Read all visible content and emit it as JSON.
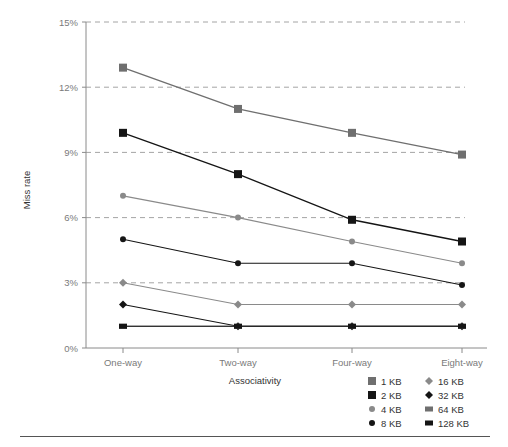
{
  "chart_data": {
    "type": "line",
    "title": "",
    "subtitle": "",
    "xlabel": "Associativity",
    "ylabel": "Miss rate",
    "categories": [
      "One-way",
      "Two-way",
      "Four-way",
      "Eight-way"
    ],
    "ytick_labels": [
      "0%",
      "3%",
      "6%",
      "9%",
      "12%",
      "15%"
    ],
    "ytick_values": [
      0,
      3,
      6,
      9,
      12,
      15
    ],
    "ylim": [
      0,
      15
    ],
    "grid": "horizontal-dashed",
    "legend_position": "bottom-right",
    "units": "percent",
    "series": [
      {
        "name": "1 KB",
        "marker": "square-large",
        "color": "#6f6f6f",
        "line_color": "#6f6f6f",
        "values": [
          12.9,
          11.0,
          9.9,
          8.9
        ]
      },
      {
        "name": "2 KB",
        "marker": "square-large",
        "color": "#151515",
        "line_color": "#151515",
        "values": [
          9.9,
          8.0,
          5.9,
          4.9
        ]
      },
      {
        "name": "4 KB",
        "marker": "circle-small",
        "color": "#8a8a8a",
        "line_color": "#8a8a8a",
        "values": [
          7.0,
          6.0,
          4.9,
          3.9
        ]
      },
      {
        "name": "8 KB",
        "marker": "circle-small",
        "color": "#151515",
        "line_color": "#151515",
        "values": [
          5.0,
          3.9,
          3.9,
          2.9
        ]
      },
      {
        "name": "16 KB",
        "marker": "diamond-small",
        "color": "#8a8a8a",
        "line_color": "#8a8a8a",
        "values": [
          3.0,
          2.0,
          2.0,
          2.0
        ]
      },
      {
        "name": "32 KB",
        "marker": "diamond-small",
        "color": "#151515",
        "line_color": "#151515",
        "values": [
          2.0,
          1.0,
          1.0,
          1.0
        ]
      },
      {
        "name": "64 KB",
        "marker": "square-wide",
        "color": "#6f6f6f",
        "line_color": "#6f6f6f",
        "values": [
          1.0,
          1.0,
          1.0,
          1.0
        ]
      },
      {
        "name": "128 KB",
        "marker": "square-wide",
        "color": "#151515",
        "line_color": "#151515",
        "values": [
          1.0,
          1.0,
          1.0,
          1.0
        ]
      }
    ]
  },
  "legend": {
    "columns": [
      [
        "1 KB",
        "2 KB",
        "4 KB",
        "8 KB"
      ],
      [
        "16 KB",
        "32 KB",
        "64 KB",
        "128 KB"
      ]
    ]
  },
  "colors": {
    "grid": "#9a9a9a",
    "axis": "#8a8a8a",
    "tick_text": "#7a7a7a",
    "text": "#333333",
    "rule": "#555555",
    "dark_series": "#151515",
    "mid_series": "#6f6f6f",
    "light_series": "#8a8a8a",
    "background": "#ffffff"
  }
}
